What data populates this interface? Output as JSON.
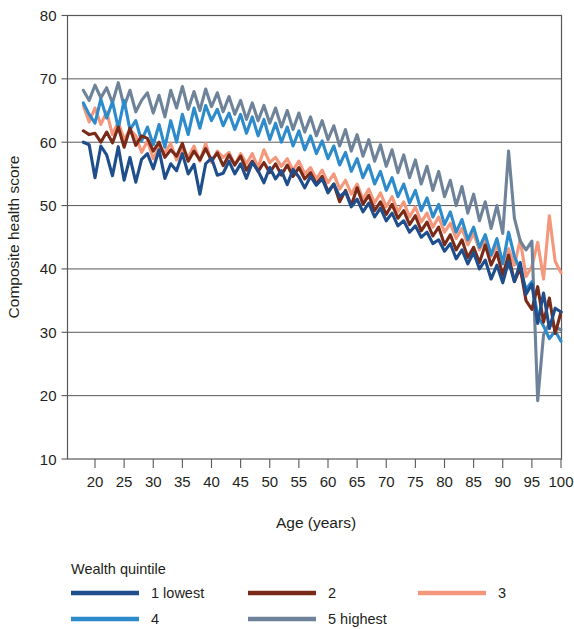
{
  "chart_data": {
    "type": "line",
    "title": "",
    "xlabel": "Age (years)",
    "ylabel": "Composite health score",
    "xlim": [
      18,
      100
    ],
    "ylim": [
      10,
      80
    ],
    "xticks": [
      20,
      25,
      30,
      35,
      40,
      45,
      50,
      55,
      60,
      65,
      70,
      75,
      80,
      85,
      90,
      95,
      100
    ],
    "yticks": [
      10,
      20,
      30,
      40,
      50,
      60,
      70,
      80
    ],
    "grid": "horizontal",
    "legend_position": "below-left",
    "legend_title": "Wealth quintile",
    "x": [
      18,
      19,
      20,
      21,
      22,
      23,
      24,
      25,
      26,
      27,
      28,
      29,
      30,
      31,
      32,
      33,
      34,
      35,
      36,
      37,
      38,
      39,
      40,
      41,
      42,
      43,
      44,
      45,
      46,
      47,
      48,
      49,
      50,
      51,
      52,
      53,
      54,
      55,
      56,
      57,
      58,
      59,
      60,
      61,
      62,
      63,
      64,
      65,
      66,
      67,
      68,
      69,
      70,
      71,
      72,
      73,
      74,
      75,
      76,
      77,
      78,
      79,
      80,
      81,
      82,
      83,
      84,
      85,
      86,
      87,
      88,
      89,
      90,
      91,
      92,
      93,
      94,
      95,
      96,
      97,
      98,
      99,
      100
    ],
    "series": [
      {
        "name": "1 lowest",
        "color": "#1f4e8c",
        "values": [
          60.0,
          59.6,
          54.4,
          59.4,
          58.0,
          54.7,
          59.3,
          54.0,
          57.6,
          53.7,
          57.3,
          58.2,
          55.8,
          58.8,
          54.3,
          56.6,
          55.5,
          58.2,
          55.0,
          56.5,
          51.8,
          56.6,
          57.5,
          54.8,
          55.1,
          57.0,
          55.0,
          56.6,
          54.3,
          56.8,
          55.5,
          53.6,
          56.0,
          54.2,
          55.5,
          53.3,
          55.7,
          54.5,
          52.8,
          54.6,
          53.2,
          54.2,
          52.0,
          53.4,
          51.4,
          52.2,
          49.8,
          51.0,
          49.0,
          50.4,
          48.2,
          49.6,
          47.6,
          48.8,
          46.8,
          47.6,
          45.8,
          46.8,
          45.0,
          45.8,
          44.0,
          44.6,
          42.8,
          44.0,
          41.6,
          43.0,
          40.8,
          42.6,
          40.0,
          41.4,
          38.4,
          40.6,
          37.8,
          41.2,
          38.0,
          41.0,
          36.0,
          37.6,
          31.4,
          36.2,
          30.6,
          33.8,
          33.2
        ]
      },
      {
        "name": "2",
        "color": "#7a2a18",
        "values": [
          61.8,
          61.2,
          61.4,
          60.0,
          61.6,
          59.9,
          62.4,
          59.2,
          62.2,
          59.5,
          61.0,
          60.6,
          58.6,
          60.0,
          57.6,
          58.8,
          57.8,
          59.8,
          57.0,
          58.6,
          57.2,
          59.0,
          57.1,
          58.3,
          56.3,
          58.0,
          56.4,
          57.8,
          55.6,
          57.0,
          55.4,
          56.8,
          55.2,
          56.6,
          54.8,
          56.4,
          54.6,
          56.0,
          54.2,
          55.2,
          53.4,
          54.6,
          52.2,
          53.4,
          50.6,
          52.4,
          50.0,
          52.8,
          50.2,
          51.6,
          49.2,
          50.6,
          48.6,
          50.2,
          48.0,
          49.2,
          47.0,
          48.4,
          46.0,
          47.4,
          45.2,
          46.6,
          43.8,
          45.4,
          43.0,
          44.6,
          41.8,
          43.4,
          41.0,
          43.8,
          40.6,
          42.6,
          39.0,
          42.2,
          38.0,
          40.2,
          35.0,
          33.6,
          37.2,
          31.6,
          35.4,
          29.8,
          33.2
        ]
      },
      {
        "name": "3",
        "color": "#f4977a",
        "values": [
          65.8,
          63.2,
          65.4,
          62.8,
          64.8,
          61.2,
          63.2,
          60.4,
          62.0,
          61.0,
          58.4,
          60.2,
          57.4,
          59.2,
          58.4,
          59.8,
          57.2,
          58.8,
          57.6,
          59.4,
          57.0,
          59.8,
          56.8,
          58.6,
          57.6,
          58.4,
          56.4,
          58.2,
          56.6,
          58.2,
          56.0,
          58.8,
          56.8,
          57.6,
          56.2,
          57.4,
          55.6,
          57.0,
          55.0,
          56.0,
          54.2,
          55.6,
          53.6,
          55.0,
          52.6,
          54.0,
          51.8,
          53.4,
          51.0,
          52.6,
          50.4,
          52.0,
          49.8,
          51.4,
          49.0,
          50.6,
          48.2,
          49.8,
          47.4,
          48.8,
          46.6,
          48.2,
          45.8,
          47.2,
          44.8,
          46.4,
          43.8,
          45.6,
          43.0,
          44.8,
          42.0,
          43.6,
          41.2,
          43.2,
          40.6,
          44.6,
          38.8,
          40.4,
          44.2,
          38.4,
          48.4,
          41.2,
          39.4
        ]
      },
      {
        "name": "4",
        "color": "#2e8bcb",
        "values": [
          66.2,
          64.4,
          63.0,
          66.8,
          63.8,
          66.4,
          62.2,
          66.6,
          62.0,
          63.4,
          60.2,
          62.4,
          59.6,
          62.8,
          59.2,
          63.4,
          60.0,
          64.4,
          61.2,
          65.4,
          62.2,
          65.8,
          63.4,
          65.2,
          62.6,
          64.6,
          62.0,
          64.4,
          61.4,
          64.0,
          61.0,
          63.6,
          60.4,
          63.0,
          60.0,
          62.4,
          59.4,
          61.8,
          58.8,
          61.0,
          58.2,
          60.2,
          57.4,
          59.4,
          56.4,
          58.4,
          55.4,
          57.4,
          54.4,
          56.4,
          53.4,
          55.4,
          52.4,
          54.4,
          51.4,
          53.4,
          50.4,
          52.4,
          49.2,
          51.2,
          48.2,
          50.2,
          47.0,
          49.0,
          45.8,
          47.8,
          44.6,
          46.6,
          43.4,
          45.4,
          42.2,
          44.8,
          40.8,
          45.8,
          42.0,
          39.8,
          36.8,
          38.0,
          32.6,
          31.0,
          29.0,
          30.2,
          28.6
        ]
      },
      {
        "name": "5 highest",
        "color": "#6e8399",
        "values": [
          68.2,
          66.6,
          69.0,
          67.0,
          68.6,
          66.2,
          69.4,
          65.6,
          68.2,
          64.8,
          66.6,
          67.8,
          64.6,
          67.4,
          64.0,
          68.2,
          65.4,
          68.8,
          65.2,
          68.0,
          65.0,
          68.4,
          65.6,
          67.8,
          64.8,
          67.2,
          64.4,
          66.6,
          63.6,
          66.2,
          63.4,
          65.8,
          63.0,
          65.4,
          62.4,
          65.0,
          62.0,
          64.6,
          61.6,
          64.0,
          61.0,
          63.4,
          60.4,
          62.6,
          59.4,
          62.0,
          58.6,
          61.2,
          57.8,
          60.4,
          57.0,
          59.6,
          56.2,
          58.8,
          55.2,
          58.0,
          54.4,
          57.2,
          53.4,
          56.2,
          52.4,
          55.4,
          51.4,
          54.0,
          50.0,
          53.0,
          48.8,
          51.8,
          47.6,
          50.6,
          46.4,
          50.0,
          45.6,
          58.6,
          48.0,
          44.4,
          43.0,
          44.4,
          19.2,
          29.6,
          31.4,
          30.8,
          30.4
        ]
      }
    ]
  },
  "axes": {
    "y_title": "Composite health score",
    "x_title": "Age (years)",
    "y_tick_labels": [
      "80",
      "70",
      "60",
      "50",
      "40",
      "30",
      "20",
      "10"
    ],
    "x_tick_labels": [
      "20",
      "25",
      "30",
      "35",
      "40",
      "45",
      "50",
      "55",
      "60",
      "65",
      "70",
      "75",
      "80",
      "85",
      "90",
      "95",
      "100"
    ]
  },
  "legend": {
    "title": "Wealth quintile",
    "entries": [
      {
        "label": "1 lowest",
        "color": "#1f4e8c"
      },
      {
        "label": "2",
        "color": "#7a2a18"
      },
      {
        "label": "3",
        "color": "#f4977a"
      },
      {
        "label": "4",
        "color": "#2e8bcb"
      },
      {
        "label": "5 highest",
        "color": "#6e8399"
      }
    ]
  },
  "colors": {
    "axis": "#58585b",
    "text": "#231f20",
    "background": "#ffffff"
  }
}
